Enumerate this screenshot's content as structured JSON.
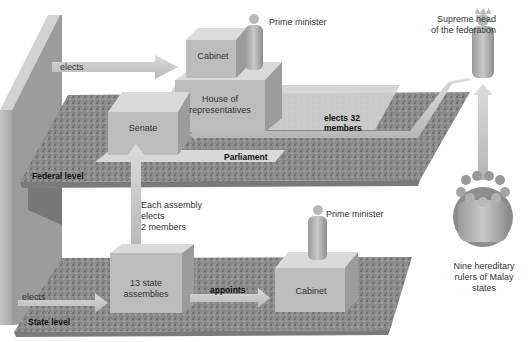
{
  "diagram": {
    "levels": {
      "federal": "Federal level",
      "state": "State level"
    },
    "federal": {
      "elects_label": "elects",
      "cabinet": "Cabinet",
      "prime_minister": "Prime minister",
      "house": "House of representatives",
      "senate": "Senate",
      "parliament": "Parliament",
      "elects32_line1": "elects 32",
      "elects32_line2": "members"
    },
    "supreme": {
      "line1": "Supreme head",
      "line2": "of the federation"
    },
    "rulers": {
      "line1": "Nine hereditary",
      "line2": "rulers of Malay",
      "line3": "states"
    },
    "state": {
      "elects_label": "elects",
      "assembly_note_line1": "Each assembly",
      "assembly_note_line2": "elects",
      "assembly_note_line3": "2 members",
      "assemblies_line1": "13 state",
      "assemblies_line2": "assemblies",
      "appoints_label": "appoints",
      "cabinet": "Cabinet",
      "prime_minister": "Prime minister"
    },
    "colors": {
      "platform": "#8a8a8a",
      "box": "#bdbdbd",
      "arrow": "#c8c8c8",
      "wall": "#9a9a9a",
      "text": "#333333"
    }
  }
}
